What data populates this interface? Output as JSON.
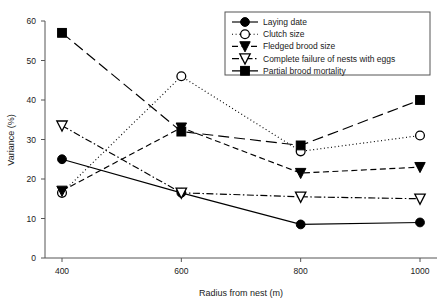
{
  "chart_data": {
    "type": "line",
    "title": "",
    "xlabel": "Radius from nest (m)",
    "ylabel": "Variance (%)",
    "x": [
      400,
      600,
      800,
      1000
    ],
    "xticklabels": [
      "400",
      "600",
      "800",
      "1000"
    ],
    "yticks": [
      0,
      10,
      20,
      30,
      40,
      50,
      60
    ],
    "yticklabels": [
      "0",
      "10",
      "20",
      "30",
      "40",
      "50",
      "60"
    ],
    "xlim": [
      350,
      1050
    ],
    "ylim": [
      0,
      60
    ],
    "grid": false,
    "legend_position": "top-right",
    "series": [
      {
        "name": "Laying date",
        "values": [
          25,
          16.5,
          8.5,
          9
        ],
        "marker": "filled-circle",
        "linestyle": "solid",
        "color": "#000000"
      },
      {
        "name": "Clutch size",
        "values": [
          16.5,
          46,
          27,
          31
        ],
        "marker": "open-circle",
        "linestyle": "dotted",
        "color": "#000000"
      },
      {
        "name": "Fledged brood size",
        "values": [
          17,
          33,
          21.5,
          23
        ],
        "marker": "filled-triangle-down",
        "linestyle": "dashed",
        "color": "#000000"
      },
      {
        "name": "Complete failure of nests with eggs",
        "values": [
          33.5,
          16.5,
          15.5,
          15
        ],
        "marker": "open-triangle-down",
        "linestyle": "dashdot",
        "color": "#000000"
      },
      {
        "name": "Partial brood mortality",
        "values": [
          57,
          32,
          28.5,
          40
        ],
        "marker": "filled-square",
        "linestyle": "longdash",
        "color": "#000000"
      }
    ]
  },
  "legend": {
    "entries": [
      "Laying date",
      "Clutch size",
      "Fledged brood size",
      "Complete failure of nests with eggs",
      "Partial brood mortality"
    ]
  },
  "axes": {
    "x_title": "Radius from nest (m)",
    "y_title": "Variance (%)",
    "x_ticks": [
      "400",
      "600",
      "800",
      "1000"
    ],
    "y_ticks": [
      "0",
      "10",
      "20",
      "30",
      "40",
      "50",
      "60"
    ]
  }
}
